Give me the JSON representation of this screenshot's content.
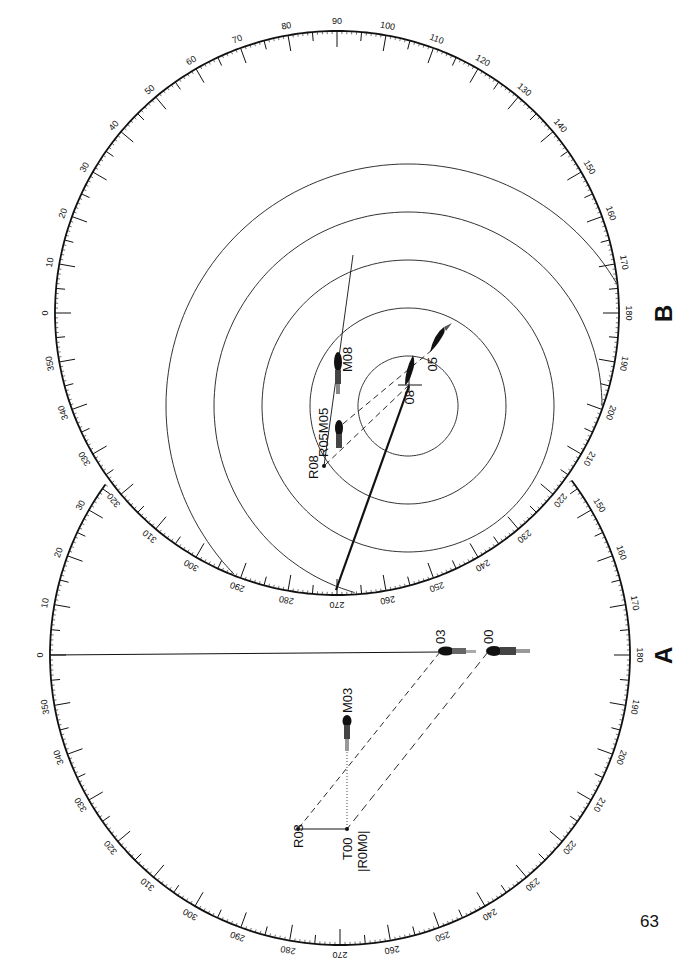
{
  "page": {
    "number": "63"
  },
  "colors": {
    "ink": "#111111",
    "paper": "#ffffff",
    "ring": "#333333"
  },
  "panels": [
    {
      "id": "A",
      "label": "A",
      "dial": {
        "cx": 340,
        "cy": 655,
        "r": 290,
        "zero_angle_screen_deg": 180,
        "direction": "cw"
      },
      "visible_bearing_labels": [
        "0",
        "10",
        "20",
        "30",
        "320",
        "310",
        "300",
        "290",
        "280",
        "270",
        "260",
        "250",
        "240",
        "230",
        "220",
        "210",
        "200",
        "190",
        "180",
        "170",
        "160",
        "150",
        "350",
        "340",
        "330"
      ],
      "heading_line": {
        "from_bearing": 0
      },
      "echoes": [
        {
          "label": "03",
          "x": 440,
          "y": 651
        },
        {
          "label": "00",
          "x": 488,
          "y": 651
        },
        {
          "label": "M03",
          "x": 347,
          "y": 722
        }
      ],
      "points": [
        {
          "label": "R03",
          "x": 298,
          "y": 829
        },
        {
          "label": "T00",
          "x": 347,
          "y": 829
        },
        {
          "label": "|R0M0|",
          "x": 347,
          "y": 829
        }
      ]
    },
    {
      "id": "B",
      "label": "B",
      "dial": {
        "cx": 337,
        "cy": 313,
        "r": 282,
        "zero_angle_screen_deg": 180,
        "direction": "cw"
      },
      "visible_bearing_labels": [
        "0",
        "10",
        "20",
        "30",
        "40",
        "50",
        "60",
        "70",
        "80",
        "90",
        "100",
        "110",
        "120",
        "130",
        "140",
        "150",
        "160",
        "170",
        "180",
        "190",
        "200",
        "210",
        "220",
        "230",
        "240",
        "250",
        "260",
        "270",
        "280",
        "290",
        "300",
        "310",
        "320",
        "330",
        "340",
        "350"
      ],
      "range_rings": {
        "cx": 408,
        "cy": 406,
        "radii": [
          50,
          98,
          146,
          194,
          242
        ]
      },
      "echoes": [
        {
          "label": "05",
          "x": 432,
          "y": 350
        },
        {
          "label": "08",
          "x": 409,
          "y": 385
        },
        {
          "label": "M08",
          "x": 338,
          "y": 356
        },
        {
          "label": "R05M05",
          "x": 338,
          "y": 428
        }
      ],
      "points": [
        {
          "label": "R08",
          "x": 324,
          "y": 466
        }
      ],
      "heading_line": {
        "from": [
          336,
          590
        ],
        "to": [
          409,
          386
        ]
      }
    }
  ]
}
